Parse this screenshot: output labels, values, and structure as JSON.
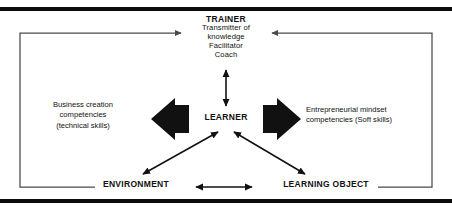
{
  "figure": {
    "ink_color": "#111111",
    "rule_color": "#0b0b0b",
    "connector_color": "#4a4a4a",
    "background": "#ffffff"
  },
  "nodes": {
    "trainer": {
      "heading": "TRAINER",
      "roles": [
        "Transmitter of",
        "knowledge",
        "Facilitator",
        "Coach"
      ]
    },
    "learner": {
      "heading": "LEARNER"
    },
    "environment": {
      "heading": "ENVIRONMENT"
    },
    "learning_object": {
      "heading": "LEARNING OBJECT"
    }
  },
  "competencies": {
    "left": {
      "lines": [
        "Business creation",
        "competencies",
        "(technical skills)"
      ]
    },
    "right": {
      "lines": [
        "Entrepreneurial mindset",
        "competencies (Soft skills)"
      ]
    }
  },
  "connectors": [
    {
      "name": "trainer-learner",
      "style": "double-headed vertical arrow"
    },
    {
      "name": "learner-environment",
      "style": "double-headed diagonal arrow"
    },
    {
      "name": "learner-learning-object",
      "style": "double-headed diagonal arrow"
    },
    {
      "name": "environment-learning-object",
      "style": "double-headed horizontal arrow"
    },
    {
      "name": "learner-to-left-competencies",
      "style": "thick block arrow pointing left"
    },
    {
      "name": "learner-to-right-competencies",
      "style": "thick block arrow pointing right"
    },
    {
      "name": "environment-to-trainer-loop",
      "style": "right-angle loop arrow into trainer"
    },
    {
      "name": "learning-object-to-trainer-loop",
      "style": "right-angle loop arrow into trainer"
    }
  ]
}
